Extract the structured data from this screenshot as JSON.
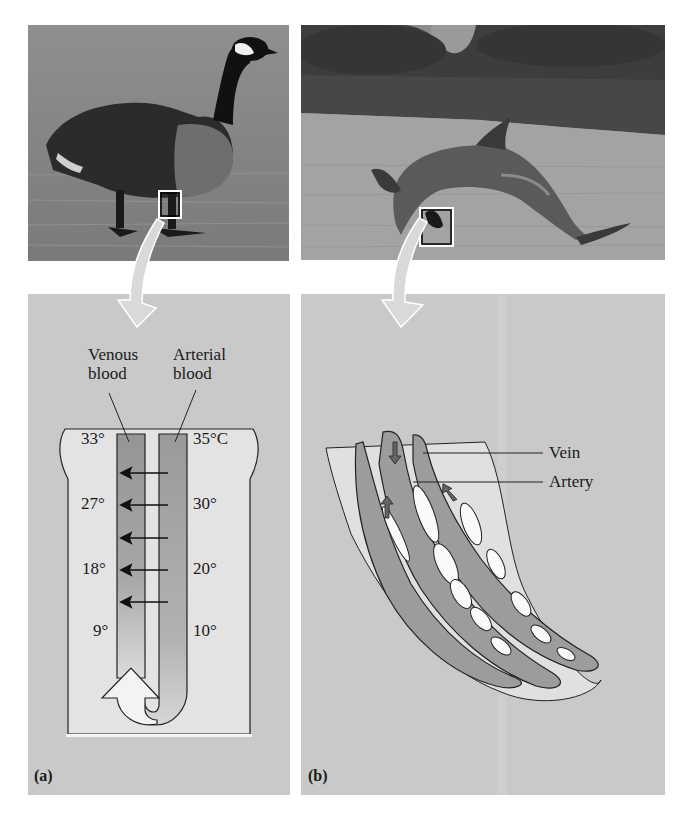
{
  "figure": {
    "panel_a": {
      "letter": "(a)",
      "subject": "Canada goose standing on ice",
      "labels": {
        "venous": "Venous\nblood",
        "venous_line1": "Venous",
        "venous_line2": "blood",
        "arterial_line1": "Arterial",
        "arterial_line2": "blood"
      },
      "venous_temps": [
        "33°",
        "27°",
        "18°",
        "9°"
      ],
      "arterial_temps": [
        "35°C",
        "30°",
        "20°",
        "10°"
      ],
      "heat_transfer_arrows": 5
    },
    "panel_b": {
      "letter": "(b)",
      "subject": "Bottlenose dolphin leaping from water",
      "labels": {
        "vein": "Vein",
        "artery": "Artery"
      }
    },
    "colors": {
      "diagram_background": "#c9c9c9",
      "tissue": "#e2e2e2",
      "vessel": "#9a9a9a",
      "outline": "#1a1a1a",
      "callout_arrow": "#d8d8d8"
    }
  }
}
